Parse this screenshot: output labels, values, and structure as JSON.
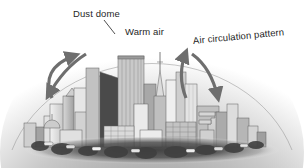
{
  "figure": {
    "background_color": "#ffffff"
  },
  "labels": {
    "dust_dome": "Dust dome",
    "warm_air": "Warm air",
    "air_circulation": "Air circulation pattern"
  },
  "colors": {
    "text": "#262626",
    "dome_center": "#9d9d9d",
    "dome_edge": "#ffffff",
    "dome_outline": "#8f8f8f",
    "arrow": "#6e6e6e",
    "leader_line": "#3a3a3a",
    "building_light": "#efefef",
    "building_mid": "#bdbdbd",
    "building_dark": "#6a6a6a",
    "building_shadow": "#3d3d3d",
    "ground": "#4a4a4a"
  },
  "elements": {
    "dome": "dust-dome-shape",
    "arrow_left": "air-circulation-arrow-left",
    "arrow_right": "air-circulation-arrow-right",
    "skyline": "city-skyline",
    "ground": "ground-foliage-band",
    "leader": "dust-dome-leader-line"
  }
}
